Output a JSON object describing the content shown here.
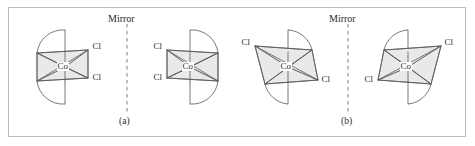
{
  "figure": {
    "type": "chemical-structure-diagram",
    "border_color": "#b9b9b9",
    "face_fill": "#e9e9e9",
    "line_color": "#585858",
    "mirror_color": "#b0b0b0",
    "background": "#ffffff"
  },
  "panels": [
    {
      "id": "a",
      "caption": "(a)",
      "mirror_label": "Mirror",
      "structures": [
        {
          "id": "a-left",
          "metal_label": "Co",
          "ligand_labels": [
            "Cl",
            "Cl"
          ],
          "arrangement": "cis",
          "chelate_arcs": 2
        },
        {
          "id": "a-right",
          "metal_label": "Co",
          "ligand_labels": [
            "Cl",
            "Cl"
          ],
          "arrangement": "cis",
          "chelate_arcs": 2
        }
      ]
    },
    {
      "id": "b",
      "caption": "(b)",
      "mirror_label": "Mirror",
      "structures": [
        {
          "id": "b-left",
          "metal_label": "Co",
          "ligand_labels": [
            "Cl",
            "Cl"
          ],
          "arrangement": "trans",
          "chelate_arcs": 2
        },
        {
          "id": "b-right",
          "metal_label": "Co",
          "ligand_labels": [
            "Cl",
            "Cl"
          ],
          "arrangement": "trans",
          "chelate_arcs": 2
        }
      ]
    }
  ],
  "labels": {
    "mirror_a": "Mirror",
    "mirror_b": "Mirror",
    "caption_a": "(a)",
    "caption_b": "(b)",
    "co_1": "Co",
    "co_2": "Co",
    "co_3": "Co",
    "co_4": "Co",
    "cl_1a": "Cl",
    "cl_1b": "Cl",
    "cl_2a": "Cl",
    "cl_2b": "Cl",
    "cl_3a": "Cl",
    "cl_3b": "Cl",
    "cl_4a": "Cl",
    "cl_4b": "Cl"
  }
}
